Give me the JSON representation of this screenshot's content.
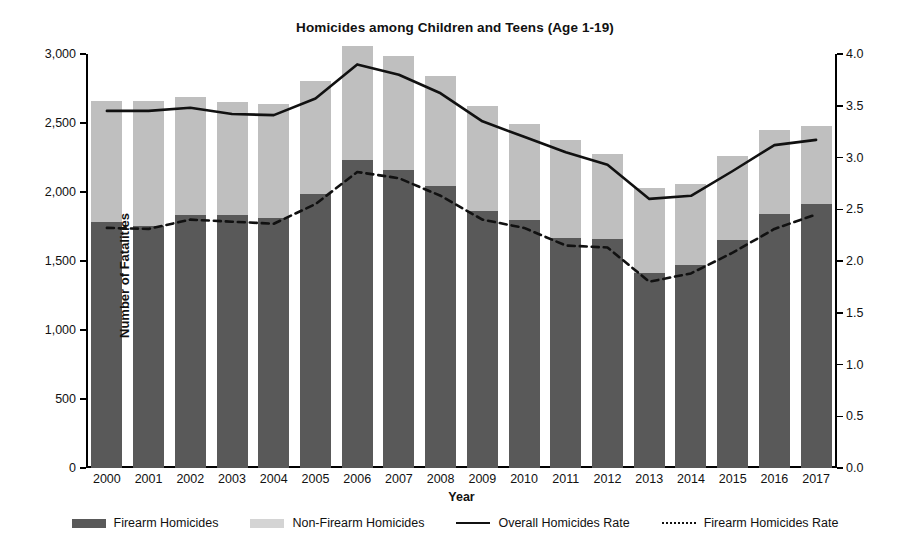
{
  "chart_data": {
    "type": "bar",
    "title": "Homicides among Children and Teens (Age 1-19)",
    "xlabel": "Year",
    "ylabel": "Number of Fatalities",
    "y2label": "Fatality Rate (per 100,000)",
    "grid": false,
    "legend_position": "bottom",
    "ylim": [
      0,
      3000
    ],
    "y2lim": [
      0,
      4.0
    ],
    "yticks": [
      0,
      500,
      1000,
      1500,
      2000,
      2500,
      3000
    ],
    "ytick_labels": [
      "0",
      "500",
      "1,000",
      "1,500",
      "2,000",
      "2,500",
      "3,000"
    ],
    "y2ticks": [
      0.0,
      0.5,
      1.0,
      1.5,
      2.0,
      2.5,
      3.0,
      3.5,
      4.0
    ],
    "y2tick_labels": [
      "0.0",
      "0.5",
      "1.0",
      "1.5",
      "2.0",
      "2.5",
      "3.0",
      "3.5",
      "4.0"
    ],
    "categories": [
      "2000",
      "2001",
      "2002",
      "2003",
      "2004",
      "2005",
      "2006",
      "2007",
      "2008",
      "2009",
      "2010",
      "2011",
      "2012",
      "2013",
      "2014",
      "2015",
      "2016",
      "2017"
    ],
    "series": [
      {
        "name": "Firearm Homicides",
        "type": "bar-stacked",
        "color": "#595959",
        "axis": "left",
        "values": [
          1780,
          1755,
          1835,
          1830,
          1815,
          1985,
          2230,
          2160,
          2040,
          1860,
          1800,
          1665,
          1660,
          1415,
          1470,
          1650,
          1840,
          1915
        ]
      },
      {
        "name": "Non-Firearm Homicides",
        "type": "bar-stacked",
        "color": "#bfbfbf",
        "axis": "left",
        "values": [
          880,
          905,
          855,
          820,
          825,
          820,
          830,
          825,
          800,
          760,
          690,
          715,
          615,
          615,
          590,
          610,
          610,
          560
        ]
      },
      {
        "name": "Overall Homicides Rate",
        "type": "line",
        "style": "solid",
        "color": "#111111",
        "axis": "right",
        "values": [
          3.45,
          3.45,
          3.48,
          3.42,
          3.41,
          3.57,
          3.9,
          3.8,
          3.62,
          3.35,
          3.2,
          3.05,
          2.93,
          2.6,
          2.63,
          2.87,
          3.12,
          3.17
        ]
      },
      {
        "name": "Firearm Homicides Rate",
        "type": "line",
        "style": "dotted",
        "color": "#111111",
        "axis": "right",
        "values": [
          2.32,
          2.31,
          2.4,
          2.38,
          2.36,
          2.55,
          2.86,
          2.8,
          2.63,
          2.4,
          2.32,
          2.15,
          2.13,
          1.8,
          1.88,
          2.08,
          2.31,
          2.45
        ]
      }
    ]
  },
  "legend": {
    "items": [
      {
        "label": "Firearm Homicides",
        "marker": "box-dark"
      },
      {
        "label": "Non-Firearm Homicides",
        "marker": "box-light"
      },
      {
        "label": "Overall Homicides  Rate",
        "marker": "line-solid"
      },
      {
        "label": "Firearm Homicides Rate",
        "marker": "line-dotted"
      }
    ]
  },
  "colors": {
    "firearm": "#595959",
    "non_firearm": "#bfbfbf",
    "line": "#111111",
    "background": "#ffffff"
  }
}
